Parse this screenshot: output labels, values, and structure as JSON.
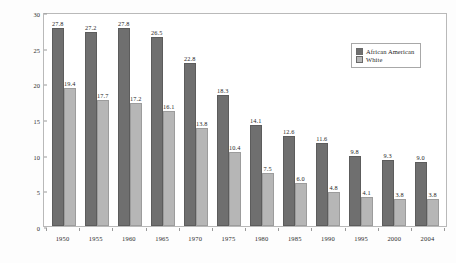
{
  "chart_data": {
    "type": "bar",
    "title": "",
    "xlabel": "",
    "ylabel": "Deaths per 1,000 Live Births",
    "ylim": [
      0,
      30
    ],
    "yticks": [
      0,
      5,
      10,
      15,
      20,
      25,
      30
    ],
    "grid": false,
    "legend_position": "top-right",
    "categories": [
      "1950",
      "1955",
      "1960",
      "1965",
      "1970",
      "1975",
      "1980",
      "1985",
      "1990",
      "1995",
      "2000",
      "2004"
    ],
    "series": [
      {
        "name": "African American",
        "color": "#6f6f6f",
        "values": [
          27.8,
          27.2,
          27.8,
          26.5,
          22.8,
          18.3,
          14.1,
          12.6,
          11.6,
          9.8,
          9.3,
          9.0
        ],
        "labels": [
          "27.8",
          "27.2",
          "27.8",
          "26.5",
          "22.8",
          "18.3",
          "14.1",
          "12.6",
          "11.6",
          "9.8",
          "9.3",
          "9.0"
        ]
      },
      {
        "name": "White",
        "color": "#b6b6b6",
        "values": [
          19.4,
          17.7,
          17.2,
          16.1,
          13.8,
          10.4,
          7.5,
          6.0,
          4.8,
          4.1,
          3.8,
          3.8
        ],
        "labels": [
          "19.4",
          "17.7",
          "17.2",
          "16.1",
          "13.8",
          "10.4",
          "7.5",
          "6.0",
          "4.8",
          "4.1",
          "3.8",
          "3.8"
        ]
      }
    ]
  },
  "legend": {
    "items": [
      {
        "label": "African American",
        "swatch": "aa"
      },
      {
        "label": "White",
        "swatch": "wh"
      }
    ]
  }
}
